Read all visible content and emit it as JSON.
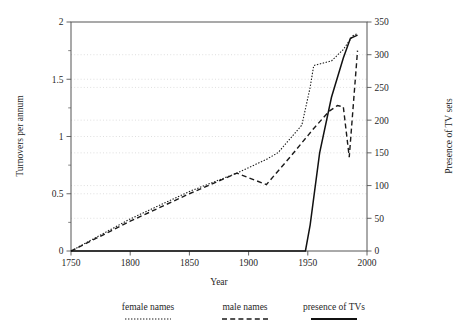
{
  "chart_data": {
    "type": "line",
    "title": "",
    "xlabel": "Year",
    "ylabel": "Turnovers per annum",
    "y2label": "Presence of TV sets",
    "xlim": [
      1750,
      2000
    ],
    "ylim": [
      0,
      2
    ],
    "y2lim": [
      0,
      350
    ],
    "xticks": [
      1750,
      1800,
      1850,
      1900,
      1950,
      2000
    ],
    "xticklabels": [
      "1750",
      "1800",
      "1850",
      "1900",
      "1950",
      "2000"
    ],
    "yticks": [
      0,
      0.5,
      1,
      1.5,
      2
    ],
    "yticklabels": [
      "0",
      "0.5",
      "1",
      "1.5",
      "2"
    ],
    "yminorticks": [
      0.25,
      0.75,
      1.25,
      1.75
    ],
    "y2ticks": [
      0,
      50,
      100,
      150,
      200,
      250,
      300,
      350
    ],
    "y2ticklabels": [
      "0",
      "50",
      "100",
      "150",
      "200",
      "250",
      "300",
      "350"
    ],
    "grid": true,
    "grid_axis": "y",
    "legend_position": "below-outside",
    "series": [
      {
        "name": "female names",
        "axis": "left",
        "style": "dotted",
        "color": "#1a1a1a",
        "x": [
          1750,
          1800,
          1850,
          1890,
          1915,
          1925,
          1945,
          1952,
          1955,
          1970,
          1980,
          1988,
          1992
        ],
        "y": [
          0.0,
          0.28,
          0.52,
          0.68,
          0.8,
          0.86,
          1.1,
          1.43,
          1.62,
          1.66,
          1.76,
          1.88,
          1.9
        ]
      },
      {
        "name": "male names",
        "axis": "left",
        "style": "dashed",
        "color": "#1a1a1a",
        "x": [
          1750,
          1800,
          1850,
          1890,
          1915,
          1935,
          1955,
          1968,
          1975,
          1980,
          1985,
          1992
        ],
        "y": [
          0.0,
          0.26,
          0.5,
          0.68,
          0.58,
          0.82,
          1.07,
          1.22,
          1.27,
          1.26,
          0.82,
          1.75
        ]
      },
      {
        "name": "presence of TVs",
        "axis": "right",
        "style": "solid",
        "color": "#111111",
        "x": [
          1750,
          1948,
          1952,
          1960,
          1970,
          1980,
          1986,
          1992
        ],
        "y": [
          0,
          0,
          40,
          150,
          235,
          295,
          325,
          330
        ]
      }
    ]
  },
  "legend": {
    "items": [
      {
        "label": "female names",
        "style": "dotted"
      },
      {
        "label": "male names",
        "style": "dashed"
      },
      {
        "label": "presence of TVs",
        "style": "solid"
      }
    ]
  }
}
